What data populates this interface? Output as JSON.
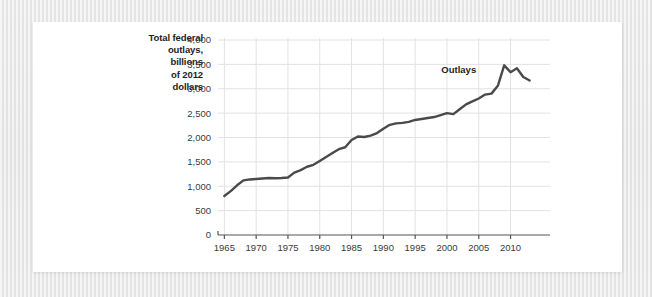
{
  "figure": {
    "axis_title": "Total federal outlays, billions of 2012 dollars",
    "axis_title_lines": [
      "Total federal",
      "outlays,",
      "billions",
      "of 2012",
      "dollars"
    ],
    "line_color": "#4a4a4a",
    "grid_color": "#e2e2e2",
    "axis_color": "#555555",
    "background_color": "#ffffff",
    "page_background_color": "#e8e8e8"
  },
  "chart_data": {
    "type": "line",
    "xlabel": "",
    "ylabel": "Total federal outlays, billions of 2012 dollars",
    "xlim": [
      1964,
      2014
    ],
    "ylim": [
      0,
      4000
    ],
    "grid": true,
    "legend": "none",
    "annotations": [
      {
        "text": "Outlays",
        "x": 2004.6,
        "y": 3330
      }
    ],
    "yticks": [
      0,
      500,
      1000,
      1500,
      2000,
      2500,
      3000,
      3500,
      4000
    ],
    "ytick_labels": [
      "0",
      "500",
      "1,000",
      "1,500",
      "2,000",
      "2,500",
      "3,000",
      "3,500",
      "4,000"
    ],
    "xticks": [
      1965,
      1970,
      1975,
      1980,
      1985,
      1990,
      1995,
      2000,
      2005,
      2010
    ],
    "xtick_labels": [
      "1965",
      "1970",
      "1975",
      "1980",
      "1985",
      "1990",
      "1995",
      "2000",
      "2005",
      "2010"
    ],
    "series": [
      {
        "name": "Outlays",
        "x": [
          1965,
          1966,
          1967,
          1968,
          1969,
          1970,
          1971,
          1972,
          1973,
          1974,
          1975,
          1976,
          1977,
          1978,
          1979,
          1980,
          1981,
          1982,
          1983,
          1984,
          1985,
          1986,
          1987,
          1988,
          1989,
          1990,
          1991,
          1992,
          1993,
          1994,
          1995,
          1996,
          1997,
          1998,
          1999,
          2000,
          2001,
          2002,
          2003,
          2004,
          2005,
          2006,
          2007,
          2008,
          2009,
          2010,
          2011,
          2012,
          2013
        ],
        "values": [
          800,
          900,
          1020,
          1120,
          1140,
          1150,
          1160,
          1170,
          1165,
          1170,
          1180,
          1280,
          1330,
          1400,
          1440,
          1520,
          1600,
          1680,
          1760,
          1800,
          1950,
          2020,
          2010,
          2040,
          2090,
          2180,
          2260,
          2290,
          2300,
          2320,
          2360,
          2380,
          2400,
          2420,
          2460,
          2500,
          2480,
          2580,
          2680,
          2740,
          2800,
          2880,
          2900,
          3060,
          3480,
          3340,
          3420,
          3240,
          3170
        ]
      }
    ]
  }
}
